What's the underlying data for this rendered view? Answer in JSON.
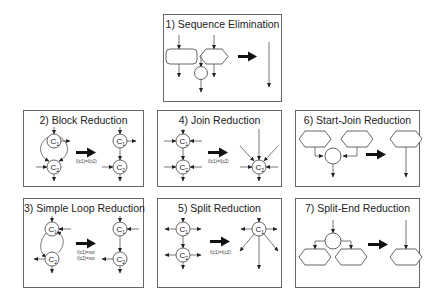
{
  "figure": {
    "panels": [
      {
        "id": 1,
        "title": "1) Sequence Elimination"
      },
      {
        "id": 2,
        "title": "2) Block Reduction",
        "condition": "I(c1)=I(c2)"
      },
      {
        "id": 3,
        "title": "3) Simple Loop Reduction",
        "conditions": [
          "I(c1)=xor",
          "I(c2)=xor"
        ]
      },
      {
        "id": 4,
        "title": "4) Join Reduction",
        "condition": "I(c1)=I(c2)"
      },
      {
        "id": 5,
        "title": "5) Split Reduction",
        "condition": "I(c1)=I(c2)"
      },
      {
        "id": 6,
        "title": "6) Start-Join Reduction"
      },
      {
        "id": 7,
        "title": "7) Split-End Reduction"
      }
    ],
    "node_labels": {
      "c1": "C",
      "c1_sub": "1",
      "c2": "C",
      "c2_sub": "2"
    },
    "colors": {
      "stroke": "#555555",
      "arrow": "#111111",
      "border": "#666666"
    }
  }
}
